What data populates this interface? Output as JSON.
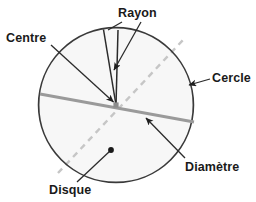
{
  "figure": {
    "title_text": "",
    "language": "fr",
    "background_color": "#ffffff"
  },
  "labels": {
    "rayon": "Rayon",
    "centre": "Centre",
    "cercle": "Cercle",
    "diametre": "Diamètre",
    "disque": "Disque"
  },
  "colors": {
    "label_text": "#1a1a1a",
    "circle_stroke": "#3a3a3a",
    "circle_fill": "#f7f7f7",
    "diameter_line": "#9a9a9a",
    "dashed_line": "#c2c2c2",
    "radius_line": "#2b2b2b",
    "leader_line": "#2b2b2b",
    "center_dot": "#8c8c8c",
    "disque_dot": "#1a1a1a"
  },
  "geometry": {
    "circle": {
      "cx": 116,
      "cy": 105,
      "r": 78
    },
    "center_point": {
      "x": 116,
      "y": 105
    },
    "diameter_solid": {
      "x1": 40,
      "y1": 94,
      "x2": 194,
      "y2": 122
    },
    "diameter_dashed": {
      "x1": 58,
      "y1": 173,
      "x2": 183,
      "y2": 40
    },
    "radius_upper_left": {
      "x1": 116,
      "y1": 105,
      "x2": 103,
      "y2": 29
    },
    "radius_to_rayon": {
      "x1": 116,
      "y1": 105,
      "x2": 133,
      "y2": 30
    },
    "disque_dot": {
      "x": 111,
      "y": 150
    }
  }
}
